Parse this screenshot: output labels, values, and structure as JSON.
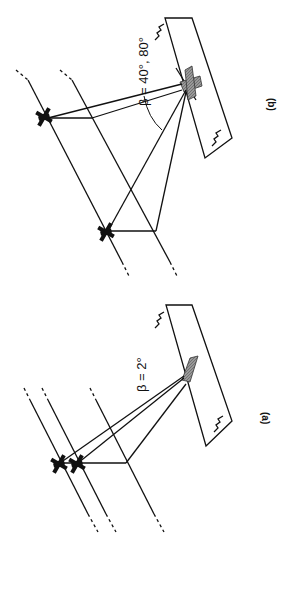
{
  "figure": {
    "orientation": "rotated 90 degrees clockwise",
    "panels": [
      {
        "id": "b",
        "caption": "(b)",
        "angle_label": "β = 40°, 80°",
        "aircraft_count": 2,
        "description": "Two aircraft on separate flight tracks with large bistatic angle converging on a shaded target area"
      },
      {
        "id": "a",
        "caption": "(a)",
        "angle_label": "β = 2°",
        "aircraft_count": 2,
        "description": "Two closely spaced aircraft on adjacent flight tracks with small bistatic angle converging on a shaded target area"
      }
    ],
    "colors": {
      "line": "#111111",
      "shade": "#888888",
      "background": "#ffffff"
    }
  }
}
